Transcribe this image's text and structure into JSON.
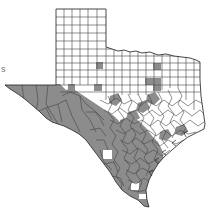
{
  "map": {
    "subject": "Texas counties",
    "colors": {
      "shaded": "#8c8c8c",
      "unshaded": "#ffffff",
      "border": "#333333",
      "background": "#ffffff"
    },
    "legend": null,
    "edge_text_fragments": [
      {
        "text": "s",
        "x": 1,
        "y": 66
      }
    ],
    "regions": {
      "panhandle": "unshaded grid of counties",
      "trans_pecos": "shaded",
      "rio_grande_border": "shaded",
      "south_texas": "mostly shaded with a few unshaded",
      "east_texas": "mostly unshaded",
      "central_texas": "mixed"
    }
  }
}
